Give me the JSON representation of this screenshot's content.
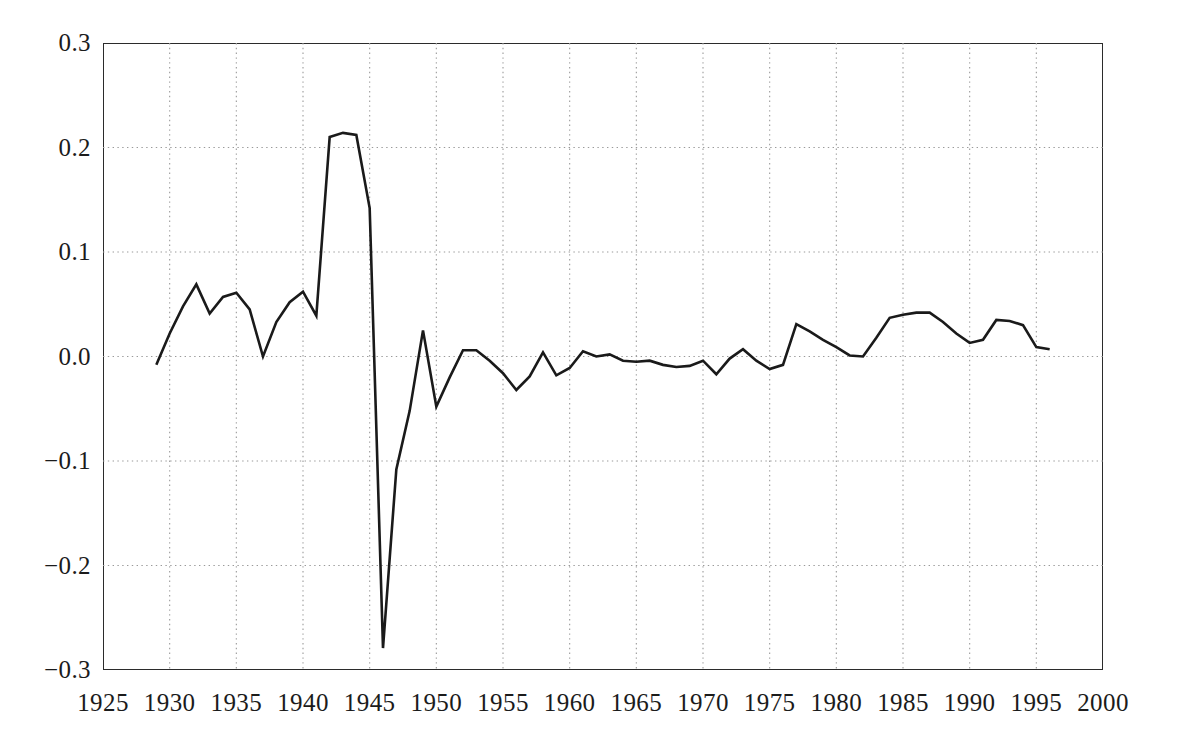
{
  "chart_data": {
    "type": "line",
    "title": "",
    "subtitle": "",
    "xlabel": "",
    "ylabel": "",
    "xlim": [
      1925,
      2000
    ],
    "ylim": [
      -0.3,
      0.3
    ],
    "xticks": [
      1925,
      1930,
      1935,
      1940,
      1945,
      1950,
      1955,
      1960,
      1965,
      1970,
      1975,
      1980,
      1985,
      1990,
      1995,
      2000
    ],
    "yticks": [
      -0.3,
      -0.2,
      -0.1,
      0.0,
      0.1,
      0.2,
      0.3
    ],
    "ytick_labels": [
      "−0.3",
      "−0.2",
      "−0.1",
      "0.0",
      "0.1",
      "0.2",
      "0.3"
    ],
    "xtick_labels": [
      "1925",
      "1930",
      "1935",
      "1940",
      "1945",
      "1950",
      "1955",
      "1960",
      "1965",
      "1970",
      "1975",
      "1980",
      "1985",
      "1990",
      "1995",
      "2000"
    ],
    "grid": true,
    "grid_style": "dotted",
    "grid_color": "#9a9a9a",
    "legend": null,
    "legend_position": "none",
    "annotations": [],
    "series": [
      {
        "name": "series-1",
        "color": "#1a1a1a",
        "line_width": 2.6,
        "x": [
          1929,
          1930,
          1931,
          1932,
          1933,
          1934,
          1935,
          1936,
          1937,
          1938,
          1939,
          1940,
          1941,
          1942,
          1943,
          1944,
          1945,
          1946,
          1947,
          1948,
          1949,
          1950,
          1951,
          1952,
          1953,
          1954,
          1955,
          1956,
          1957,
          1958,
          1959,
          1960,
          1961,
          1962,
          1963,
          1964,
          1965,
          1966,
          1967,
          1968,
          1969,
          1970,
          1971,
          1972,
          1973,
          1974,
          1975,
          1976,
          1977,
          1978,
          1979,
          1980,
          1981,
          1982,
          1983,
          1984,
          1985,
          1986,
          1987,
          1988,
          1989,
          1990,
          1991,
          1992,
          1993,
          1994,
          1995,
          1996
        ],
        "y": [
          -0.008,
          0.022,
          0.048,
          0.069,
          0.041,
          0.057,
          0.061,
          0.045,
          0.0,
          0.033,
          0.052,
          0.062,
          0.039,
          0.21,
          0.214,
          0.212,
          0.142,
          -0.279,
          -0.108,
          -0.052,
          0.025,
          -0.048,
          -0.02,
          0.006,
          0.006,
          -0.004,
          -0.016,
          -0.032,
          -0.019,
          0.004,
          -0.018,
          -0.011,
          0.005,
          0.0,
          0.002,
          -0.004,
          -0.005,
          -0.004,
          -0.008,
          -0.01,
          -0.009,
          -0.004,
          -0.017,
          -0.002,
          0.007,
          -0.004,
          -0.012,
          -0.008,
          0.031,
          0.024,
          0.016,
          0.009,
          0.001,
          0.0,
          0.018,
          0.037,
          0.04,
          0.042,
          0.042,
          0.033,
          0.022,
          0.013,
          0.016,
          0.035,
          0.034,
          0.03,
          0.009,
          0.007
        ]
      }
    ]
  },
  "axis": {
    "y_labels": [
      "0.3",
      "0.2",
      "0.1",
      "0.0",
      "−0.1",
      "−0.2",
      "−0.3"
    ],
    "x_labels": [
      "1925",
      "1930",
      "1935",
      "1940",
      "1945",
      "1950",
      "1955",
      "1960",
      "1965",
      "1970",
      "1975",
      "1980",
      "1985",
      "1990",
      "1995",
      "2000"
    ]
  }
}
